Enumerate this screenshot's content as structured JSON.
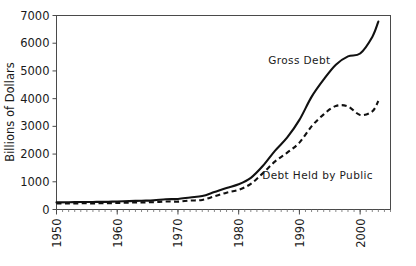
{
  "chart_data": {
    "type": "line",
    "title": "",
    "xlabel": "",
    "ylabel": "Billions of Dollars",
    "xlim": [
      1950,
      2005
    ],
    "ylim": [
      0,
      7000
    ],
    "grid": false,
    "legend_position": "inline-annotations",
    "x_tick_labels": [
      "1950",
      "1960",
      "1970",
      "1980",
      "1990",
      "2000"
    ],
    "x_ticks": [
      1950,
      1960,
      1970,
      1980,
      1990,
      2000
    ],
    "x_minor_tick_interval": 1,
    "y_tick_labels": [
      "0",
      "1000",
      "2000",
      "3000",
      "4000",
      "5000",
      "6000",
      "7000"
    ],
    "y_ticks": [
      0,
      1000,
      2000,
      3000,
      4000,
      5000,
      6000,
      7000
    ],
    "annotations": [
      {
        "text": "Gross Debt",
        "x": 1990,
        "y": 5250
      },
      {
        "text": "Debt Held by Public",
        "x": 1993,
        "y": 1100
      }
    ],
    "x": [
      1950,
      1952,
      1954,
      1956,
      1958,
      1960,
      1962,
      1964,
      1966,
      1968,
      1970,
      1972,
      1974,
      1976,
      1978,
      1980,
      1982,
      1984,
      1986,
      1988,
      1990,
      1992,
      1994,
      1996,
      1998,
      2000,
      2002,
      2003
    ],
    "series": [
      {
        "name": "Gross Debt",
        "style": "solid",
        "values": [
          257,
          259,
          271,
          273,
          276,
          291,
          303,
          317,
          329,
          369,
          381,
          436,
          484,
          629,
          776,
          909,
          1142,
          1577,
          2125,
          2602,
          3233,
          4065,
          4693,
          5225,
          5526,
          5629,
          6228,
          6783
        ]
      },
      {
        "name": "Debt Held by Public",
        "style": "dashed",
        "values": [
          219,
          214,
          224,
          222,
          226,
          237,
          248,
          257,
          264,
          290,
          283,
          323,
          344,
          477,
          607,
          712,
          925,
          1313,
          1736,
          2050,
          2412,
          3000,
          3433,
          3734,
          3721,
          3410,
          3540,
          3913
        ]
      }
    ]
  },
  "axis": {
    "y_title": "Billions of Dollars"
  }
}
